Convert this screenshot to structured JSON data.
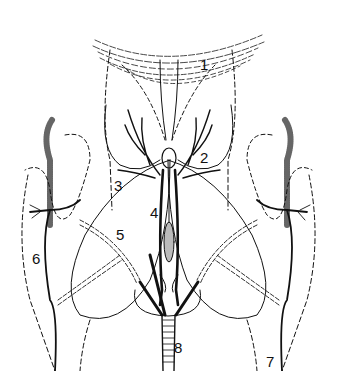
{
  "diagram": {
    "type": "anatomical line drawing",
    "background": "#ffffff",
    "ink": "#111111",
    "labels": [
      {
        "text": "1",
        "x": 200,
        "y": 57
      },
      {
        "text": "2",
        "x": 200,
        "y": 150
      },
      {
        "text": "3",
        "x": 114,
        "y": 178
      },
      {
        "text": "4",
        "x": 150,
        "y": 205
      },
      {
        "text": "5",
        "x": 116,
        "y": 227
      },
      {
        "text": "6",
        "x": 32,
        "y": 251
      },
      {
        "text": "7",
        "x": 266,
        "y": 354
      },
      {
        "text": "8",
        "x": 174,
        "y": 340
      }
    ]
  }
}
